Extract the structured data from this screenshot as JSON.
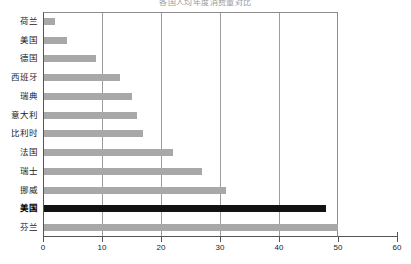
{
  "chart_data": {
    "type": "bar",
    "orientation": "horizontal",
    "title": "各国人均年度消费量对比",
    "xlabel": "",
    "ylabel": "",
    "xlim": [
      0,
      60
    ],
    "xticks": [
      0,
      10,
      20,
      30,
      40,
      50,
      60
    ],
    "grid": "vertical",
    "legend": "none",
    "categories": [
      "荷兰",
      "美国",
      "德国",
      "西班牙",
      "瑞典",
      "意大利",
      "比利时",
      "法国",
      "瑞士",
      "挪威",
      "美国",
      "芬兰"
    ],
    "values": [
      2,
      4,
      9,
      13,
      15,
      16,
      17,
      22,
      27,
      31,
      48,
      50
    ],
    "highlight_index": 10,
    "colors": {
      "bar": "#a8a8a8",
      "bar_highlight": "#121212",
      "grid": "#9d9d9d",
      "axis": "#555555",
      "text": "#1a1a1a",
      "background": "#ffffff"
    }
  }
}
